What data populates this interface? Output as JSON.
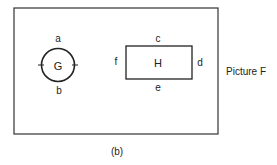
{
  "diagram": {
    "frame_label": "Picture F",
    "caption": "(b)",
    "circle": {
      "name": "G",
      "top": "a",
      "bottom": "b"
    },
    "rectangle": {
      "name": "H",
      "top": "c",
      "right": "d",
      "bottom": "e",
      "left": "f"
    },
    "stroke_color": "#222222",
    "background": "#ffffff"
  }
}
